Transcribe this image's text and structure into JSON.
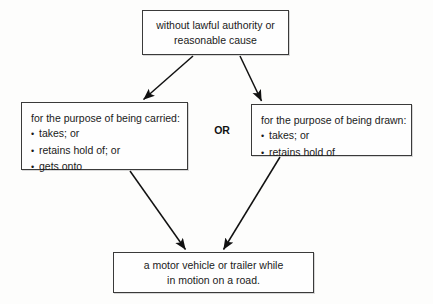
{
  "diagram": {
    "title": "",
    "connector_label": "OR",
    "colors": {
      "background": "#fdfdfc",
      "box_border": "#3a3a3a",
      "box_fill": "#fefefe",
      "text": "#1a1a1a",
      "arrow": "#111111"
    },
    "nodes": {
      "top": {
        "lines": [
          "without lawful authority or",
          "reasonable cause"
        ]
      },
      "left": {
        "heading": "for the purpose of being carried:",
        "bullets": [
          "takes; or",
          "retains hold of; or",
          "gets onto"
        ],
        "bullet_glyph": "•"
      },
      "right": {
        "heading": "for the purpose of being drawn:",
        "bullets": [
          "takes; or",
          "retains hold of"
        ],
        "bullet_glyph": "•"
      },
      "bottom": {
        "lines": [
          "a motor vehicle or trailer while",
          "in motion on a road."
        ]
      }
    },
    "edges": [
      {
        "from": "top",
        "to": "left"
      },
      {
        "from": "top",
        "to": "right"
      },
      {
        "from": "left",
        "to": "bottom"
      },
      {
        "from": "right",
        "to": "bottom"
      }
    ]
  }
}
